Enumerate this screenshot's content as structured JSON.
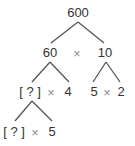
{
  "diagram": {
    "type": "factor-tree",
    "root": {
      "label": "600"
    },
    "level1": {
      "left": "60",
      "operator": "×",
      "right": "10"
    },
    "level2": {
      "left": {
        "unknown": "[ ? ]",
        "operator": "×",
        "value": "4"
      },
      "right": {
        "a": "5",
        "operator": "×",
        "b": "2"
      }
    },
    "level3": {
      "left": {
        "unknown": "[ ? ]",
        "operator": "×",
        "value": "5"
      }
    },
    "colors": {
      "text": "#333333",
      "operator": "#888888",
      "line": "#555555"
    }
  }
}
